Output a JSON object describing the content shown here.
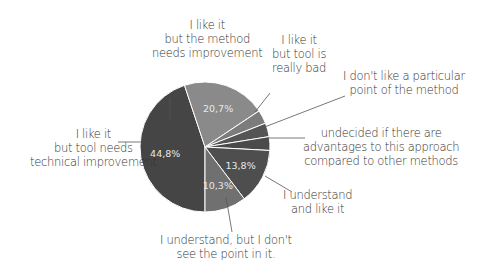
{
  "chart_data": {
    "type": "pie",
    "title": "",
    "center": [
      205,
      147
    ],
    "radius": 65,
    "start_angle_deg": 90,
    "slices": [
      {
        "label": "I like it but tool needs technical improvement",
        "value": 44.8,
        "display": "44,8%",
        "color": "#454545"
      },
      {
        "label": "I like it but the method needs improvement",
        "value": 20.7,
        "display": "20,7%",
        "color": "#8a8a8a"
      },
      {
        "label": "I like it but tool is really bad",
        "value": 3.4,
        "display": "",
        "color": "#7c7c7c"
      },
      {
        "label": "I don't like a particular point of the method",
        "value": 3.4,
        "display": "",
        "color": "#555555"
      },
      {
        "label": "undecided if there are advantages to this approach compared to other methods",
        "value": 3.4,
        "display": "",
        "color": "#4a4a4a"
      },
      {
        "label": "I understand and like it",
        "value": 13.8,
        "display": "13,8%",
        "color": "#4e4e4e"
      },
      {
        "label": "I understand, but I don't see the point in it.",
        "value": 10.3,
        "display": "10,3%",
        "color": "#707070"
      }
    ]
  },
  "labels": {
    "tech": [
      "I like it",
      "but tool needs",
      "technical improvement"
    ],
    "method": [
      "I like it",
      "but the method",
      "needs improvement"
    ],
    "bad": [
      "I like it",
      "but tool is",
      "really bad"
    ],
    "point": [
      "I don't like a particular",
      "point of the method"
    ],
    "undecided": [
      "undecided if there are",
      "advantages to  this approach",
      "compared to other methods"
    ],
    "like": [
      "I understand",
      "and like it"
    ],
    "nopoint": [
      "I understand, but I don't",
      "see the point in it."
    ]
  }
}
